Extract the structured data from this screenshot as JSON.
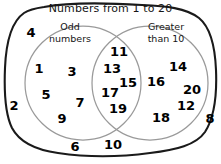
{
  "diagram": {
    "title": "Numbers from 1 to 20",
    "type": "venn",
    "background_color": "#ffffff",
    "outline_color": "#1a1a1a",
    "circle_color": "#8a8a8a",
    "text_color": "#000000",
    "sets": [
      {
        "id": "odd",
        "label_line1": "Odd",
        "label_line2": "numbers"
      },
      {
        "id": "greater",
        "label_line1": "Greater",
        "label_line2": "than 10"
      }
    ],
    "regions": {
      "odd_only": {
        "name": "odd-only-region",
        "members": [
          {
            "value": "1",
            "x": 39,
            "y": 68
          },
          {
            "value": "3",
            "x": 72,
            "y": 71
          },
          {
            "value": "5",
            "x": 46,
            "y": 94
          },
          {
            "value": "7",
            "x": 80,
            "y": 102
          },
          {
            "value": "9",
            "x": 62,
            "y": 118
          }
        ]
      },
      "intersection": {
        "name": "intersection-region",
        "members": [
          {
            "value": "11",
            "x": 119,
            "y": 51
          },
          {
            "value": "13",
            "x": 112,
            "y": 68
          },
          {
            "value": "15",
            "x": 128,
            "y": 82
          },
          {
            "value": "17",
            "x": 110,
            "y": 92
          },
          {
            "value": "19",
            "x": 118,
            "y": 108
          }
        ]
      },
      "greater_only": {
        "name": "greater-only-region",
        "members": [
          {
            "value": "14",
            "x": 178,
            "y": 66
          },
          {
            "value": "16",
            "x": 156,
            "y": 81
          },
          {
            "value": "20",
            "x": 192,
            "y": 89
          },
          {
            "value": "12",
            "x": 186,
            "y": 105
          },
          {
            "value": "18",
            "x": 161,
            "y": 117
          }
        ]
      },
      "outside": {
        "name": "outside-region",
        "members": [
          {
            "value": "4",
            "x": 31,
            "y": 32
          },
          {
            "value": "2",
            "x": 14,
            "y": 105
          },
          {
            "value": "6",
            "x": 75,
            "y": 146
          },
          {
            "value": "10",
            "x": 113,
            "y": 144
          },
          {
            "value": "8",
            "x": 210,
            "y": 118
          }
        ]
      }
    }
  }
}
